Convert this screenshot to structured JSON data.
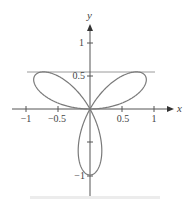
{
  "chart_data": {
    "type": "line",
    "title": "",
    "xlabel": "x",
    "ylabel": "y",
    "xlim": [
      -1.0,
      1.25
    ],
    "ylim": [
      -1.35,
      1.3
    ],
    "x_ticks": [
      -1,
      -0.5,
      0.5,
      1
    ],
    "x_tick_labels": [
      "−1",
      "−0.5",
      "0.5",
      "1"
    ],
    "y_ticks": [
      1,
      0.5,
      -0.5,
      -1
    ],
    "y_tick_labels": [
      "1",
      "0.5",
      "",
      "−1"
    ],
    "grid": false,
    "series": [
      {
        "name": "r = sin(3θ)",
        "polar": true,
        "r_expression": "sin(3*theta)",
        "theta_range": [
          0,
          3.14159
        ],
        "color": "#777777"
      },
      {
        "name": "horizontal tangent",
        "type": "hline",
        "y": 0.56,
        "x_range": [
          -1.0,
          1.0
        ],
        "color": "#999999"
      }
    ]
  },
  "axes": {
    "x_label": "x",
    "y_label": "y",
    "tick_labels": {
      "x_neg1": "−1",
      "x_neg05": "−0.5",
      "x_05": "0.5",
      "x_1": "1",
      "y_1": "1",
      "y_05": "0.5",
      "y_neg1": "−1"
    }
  }
}
